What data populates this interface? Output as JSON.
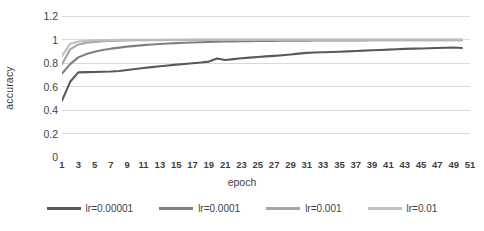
{
  "chart_data": {
    "type": "line",
    "title": "",
    "xlabel": "epoch",
    "ylabel": "accuracy",
    "ylim": [
      0,
      1.2
    ],
    "xlim": [
      1,
      51
    ],
    "grid": true,
    "legend_position": "bottom",
    "y_ticks": [
      "0",
      "0.2",
      "0.4",
      "0.6",
      "0.8",
      "1",
      "1.2"
    ],
    "y_tick_values": [
      0,
      0.2,
      0.4,
      0.6,
      0.8,
      1,
      1.2
    ],
    "x_ticks": [
      "1",
      "3",
      "5",
      "7",
      "9",
      "11",
      "13",
      "15",
      "17",
      "19",
      "21",
      "23",
      "25",
      "27",
      "29",
      "31",
      "33",
      "35",
      "37",
      "39",
      "41",
      "43",
      "45",
      "47",
      "49",
      "51"
    ],
    "x": [
      1,
      2,
      3,
      4,
      5,
      6,
      7,
      8,
      9,
      10,
      11,
      12,
      13,
      14,
      15,
      16,
      17,
      18,
      19,
      20,
      21,
      22,
      23,
      24,
      25,
      26,
      27,
      28,
      29,
      30,
      31,
      32,
      33,
      34,
      35,
      36,
      37,
      38,
      39,
      40,
      41,
      42,
      43,
      44,
      45,
      46,
      47,
      48,
      49,
      50
    ],
    "series": [
      {
        "name": "lr=0.00001",
        "color": "#595959",
        "values": [
          0.48,
          0.64,
          0.72,
          0.722,
          0.724,
          0.726,
          0.728,
          0.732,
          0.74,
          0.749,
          0.757,
          0.765,
          0.772,
          0.779,
          0.786,
          0.792,
          0.798,
          0.804,
          0.812,
          0.838,
          0.826,
          0.833,
          0.84,
          0.846,
          0.851,
          0.856,
          0.861,
          0.866,
          0.872,
          0.88,
          0.886,
          0.889,
          0.891,
          0.893,
          0.896,
          0.899,
          0.902,
          0.905,
          0.908,
          0.911,
          0.914,
          0.917,
          0.92,
          0.922,
          0.924,
          0.926,
          0.928,
          0.93,
          0.932,
          0.928
        ]
      },
      {
        "name": "lr=0.0001",
        "color": "#7f7f7f",
        "values": [
          0.71,
          0.79,
          0.848,
          0.876,
          0.896,
          0.911,
          0.922,
          0.931,
          0.939,
          0.946,
          0.952,
          0.957,
          0.962,
          0.966,
          0.969,
          0.972,
          0.975,
          0.977,
          0.979,
          0.981,
          0.983,
          0.984,
          0.985,
          0.986,
          0.987,
          0.988,
          0.988,
          0.989,
          0.989,
          0.99,
          0.99,
          0.991,
          0.991,
          0.991,
          0.992,
          0.992,
          0.992,
          0.992,
          0.993,
          0.993,
          0.993,
          0.993,
          0.993,
          0.993,
          0.993,
          0.994,
          0.994,
          0.994,
          0.994,
          0.994
        ]
      },
      {
        "name": "lr=0.001",
        "color": "#a6a6a6",
        "values": [
          0.79,
          0.916,
          0.958,
          0.972,
          0.98,
          0.985,
          0.988,
          0.99,
          0.992,
          0.993,
          0.994,
          0.995,
          0.995,
          0.996,
          0.996,
          0.996,
          0.997,
          0.997,
          0.997,
          0.997,
          0.997,
          0.998,
          0.998,
          0.998,
          0.998,
          0.998,
          0.998,
          0.998,
          0.998,
          0.998,
          0.998,
          0.998,
          0.998,
          0.998,
          0.998,
          0.998,
          0.998,
          0.998,
          0.998,
          0.998,
          0.998,
          0.998,
          0.998,
          0.998,
          0.998,
          0.998,
          0.998,
          0.998,
          0.998,
          0.998
        ]
      },
      {
        "name": "lr=0.01",
        "color": "#bfbfbf",
        "values": [
          0.86,
          0.963,
          0.983,
          0.99,
          0.993,
          0.995,
          0.996,
          0.997,
          0.997,
          0.998,
          0.998,
          0.998,
          0.998,
          0.999,
          0.999,
          0.999,
          0.999,
          0.999,
          0.999,
          0.999,
          0.999,
          0.999,
          0.999,
          0.999,
          0.999,
          0.999,
          0.999,
          0.999,
          0.999,
          0.999,
          0.999,
          0.999,
          0.999,
          0.999,
          0.999,
          0.999,
          0.999,
          0.999,
          0.999,
          0.999,
          0.999,
          0.999,
          0.999,
          0.999,
          0.999,
          0.999,
          0.999,
          0.999,
          0.999,
          0.999
        ]
      }
    ]
  },
  "style": {
    "gridline_color": "#d9d9d9",
    "text_color": "#3f3f3f",
    "background": "#ffffff"
  }
}
